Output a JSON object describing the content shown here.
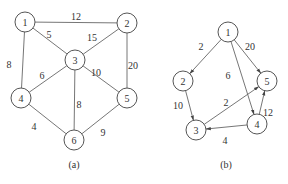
{
  "graph_a": {
    "caption": "(a)",
    "directed": false,
    "nodes": [
      {
        "id": "1",
        "label": "1",
        "x": 25,
        "y": 22
      },
      {
        "id": "2",
        "label": "2",
        "x": 127,
        "y": 23
      },
      {
        "id": "3",
        "label": "3",
        "x": 75,
        "y": 60
      },
      {
        "id": "4",
        "label": "4",
        "x": 21,
        "y": 98
      },
      {
        "id": "5",
        "label": "5",
        "x": 127,
        "y": 98
      },
      {
        "id": "6",
        "label": "6",
        "x": 74,
        "y": 140
      }
    ],
    "edges": [
      {
        "from": "1",
        "to": "2",
        "weight": "12",
        "lx": 76,
        "ly": 20
      },
      {
        "from": "1",
        "to": "3",
        "weight": "5",
        "lx": 49,
        "ly": 38
      },
      {
        "from": "1",
        "to": "4",
        "weight": "8",
        "lx": 9,
        "ly": 68
      },
      {
        "from": "2",
        "to": "3",
        "weight": "15",
        "lx": 92,
        "ly": 41
      },
      {
        "from": "2",
        "to": "5",
        "weight": "20",
        "lx": 133,
        "ly": 69
      },
      {
        "from": "3",
        "to": "4",
        "weight": "6",
        "lx": 42,
        "ly": 79
      },
      {
        "from": "3",
        "to": "5",
        "weight": "10",
        "lx": 96,
        "ly": 76
      },
      {
        "from": "3",
        "to": "6",
        "weight": "8",
        "lx": 79,
        "ly": 108
      },
      {
        "from": "4",
        "to": "6",
        "weight": "4",
        "lx": 34,
        "ly": 130
      },
      {
        "from": "5",
        "to": "6",
        "weight": "9",
        "lx": 103,
        "ly": 136
      }
    ]
  },
  "graph_b": {
    "caption": "(b)",
    "directed": true,
    "nodes": [
      {
        "id": "1",
        "label": "1",
        "x": 228,
        "y": 32
      },
      {
        "id": "2",
        "label": "2",
        "x": 183,
        "y": 81
      },
      {
        "id": "3",
        "label": "3",
        "x": 196,
        "y": 130
      },
      {
        "id": "4",
        "label": "4",
        "x": 257,
        "y": 124
      },
      {
        "id": "5",
        "label": "5",
        "x": 267,
        "y": 81
      }
    ],
    "edges": [
      {
        "from": "1",
        "to": "2",
        "weight": "2",
        "lx": 201,
        "ly": 50
      },
      {
        "from": "1",
        "to": "5",
        "weight": "20",
        "lx": 250,
        "ly": 50
      },
      {
        "from": "1",
        "to": "4",
        "weight": "6",
        "lx": 228,
        "ly": 79
      },
      {
        "from": "2",
        "to": "3",
        "weight": "10",
        "lx": 178,
        "ly": 109
      },
      {
        "from": "3",
        "to": "5",
        "weight": "2",
        "lx": 226,
        "ly": 106
      },
      {
        "from": "4",
        "to": "3",
        "weight": "4",
        "lx": 225,
        "ly": 144
      },
      {
        "from": "4",
        "to": "5",
        "weight": "12",
        "lx": 268,
        "ly": 116
      }
    ]
  },
  "captions": {
    "a_x": 74,
    "a_y": 168,
    "b_x": 226,
    "b_y": 168
  }
}
